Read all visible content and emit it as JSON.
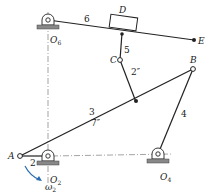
{
  "diagram": {
    "type": "planar linkage mechanism",
    "colors": {
      "link": "#222222",
      "ground_hatch": "#555555",
      "center_line": "#555555",
      "omega_arrow": "#2b6cb0",
      "background": "#ffffff"
    },
    "points": {
      "O6": {
        "label": "O",
        "sub": "6"
      },
      "O2": {
        "label": "O",
        "sub": "2"
      },
      "O4": {
        "label": "O",
        "sub": "4"
      },
      "A": {
        "label": "A"
      },
      "B": {
        "label": "B"
      },
      "C": {
        "label": "C"
      },
      "D": {
        "label": "D"
      },
      "E": {
        "label": "E"
      }
    },
    "links": {
      "l2": {
        "label": "2"
      },
      "l3": {
        "label": "3",
        "length": "7″"
      },
      "l4": {
        "label": "4"
      },
      "l5": {
        "label": "5",
        "length": "2″"
      },
      "l6": {
        "label": "6"
      }
    },
    "omega": {
      "label": "ω",
      "sub": "2"
    }
  }
}
